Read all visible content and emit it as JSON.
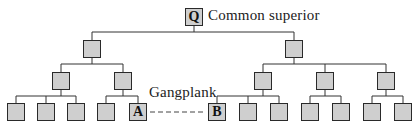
{
  "diagram": {
    "title_label": "Common superior",
    "gangplank_label": "Gangplank",
    "node_q": "Q",
    "node_a": "A",
    "node_b": "B",
    "colors": {
      "node_fill": "#cfcfcf",
      "line": "#333333"
    }
  }
}
